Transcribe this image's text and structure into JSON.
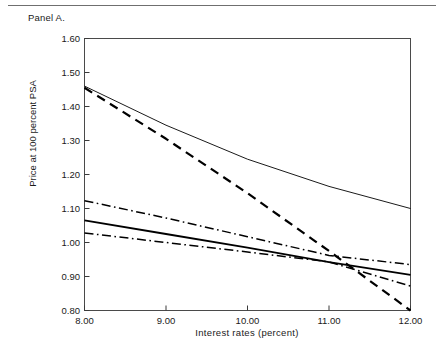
{
  "panel": {
    "label": "Panel A."
  },
  "chart_data": {
    "type": "line",
    "title": "Panel A.",
    "xlabel": "Interest rates (percent)",
    "ylabel": "Price at 100 percent PSA",
    "xlim": [
      8.0,
      12.0
    ],
    "ylim": [
      0.8,
      1.6
    ],
    "xticks": [
      "8.00",
      "9.00",
      "10.00",
      "11.00",
      "12.00"
    ],
    "xtick_values": [
      8.0,
      9.0,
      10.0,
      11.0,
      12.0
    ],
    "yticks": [
      "0.80",
      "0.90",
      "1.00",
      "1.10",
      "1.20",
      "1.30",
      "1.40",
      "1.50",
      "1.60"
    ],
    "ytick_values": [
      0.8,
      0.9,
      1.0,
      1.1,
      1.2,
      1.3,
      1.4,
      1.5,
      1.6
    ],
    "grid": false,
    "legend": "none",
    "x": [
      8.0,
      9.0,
      10.0,
      11.0,
      12.0
    ],
    "series": [
      {
        "name": "thin-solid-upper",
        "style": "solid",
        "width": 0.9,
        "color": "#000000",
        "values": [
          1.46,
          1.345,
          1.245,
          1.165,
          1.1
        ]
      },
      {
        "name": "thick-dashed",
        "style": "dashed",
        "width": 2.2,
        "color": "#000000",
        "values": [
          1.455,
          1.305,
          1.145,
          0.975,
          0.8
        ]
      },
      {
        "name": "dash-dot-upper",
        "style": "dash-dot",
        "width": 1.5,
        "color": "#000000",
        "values": [
          1.123,
          1.072,
          1.017,
          0.962,
          0.935
        ]
      },
      {
        "name": "thick-solid-lower",
        "style": "solid",
        "width": 1.8,
        "color": "#000000",
        "values": [
          1.065,
          1.025,
          0.985,
          0.942,
          0.905
        ]
      },
      {
        "name": "dash-dot-lower",
        "style": "dash-dot",
        "width": 1.5,
        "color": "#000000",
        "values": [
          1.028,
          1.0,
          0.972,
          0.943,
          0.872
        ]
      }
    ]
  }
}
